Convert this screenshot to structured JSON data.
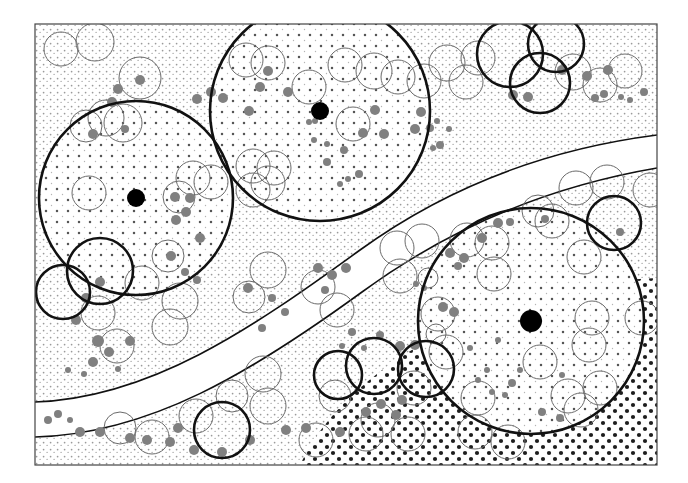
{
  "figure": {
    "title": "",
    "type": "geological-stipple-map",
    "width": 688,
    "height": 483,
    "background_color": "#ffffff",
    "frame": {
      "x": 35,
      "y": 24,
      "width": 622,
      "height": 441,
      "stroke": "#444444",
      "stroke_width": 1.2,
      "fill": "#ffffff"
    }
  },
  "palette": {
    "frame_stroke": "#444444",
    "bold_circle_stroke": "#111111",
    "thin_circle_stroke": "#6a6a6a",
    "grey_blob_fill": "#808080",
    "black_marker_fill": "#000000",
    "fine_stipple_dot": "#9a9a9a",
    "medium_stipple_dot": "#555555",
    "dense_stipple_dot": "#111111",
    "band_fill": "#ffffff",
    "band_stroke": "#111111"
  },
  "regions": [
    {
      "name": "upper-left-fine-stipple-domain",
      "stipple": "fine-light",
      "dot_color": "#9a9a9a",
      "dot_radius": 0.9,
      "spacing": 7
    },
    {
      "name": "upper-right-fine-stipple-domain",
      "stipple": "fine-light",
      "dot_color": "#9a9a9a",
      "dot_radius": 0.9,
      "spacing": 7
    },
    {
      "name": "lower-right-dense-stipple-domain",
      "stipple": "coarse-dark",
      "dot_color": "#111111",
      "dot_radius": 2.1,
      "spacing": 12
    },
    {
      "name": "central-white-band",
      "stipple": "none",
      "dot_color": "#ffffff",
      "dot_radius": 0,
      "spacing": 0
    }
  ],
  "bands": [
    {
      "name": "main-curved-band",
      "upper_path": "M 35,402 C 150,398 250,330 360,250 C 440,192 540,150 657,135",
      "lower_path": "M 35,437 C 150,434 252,372 362,292 C 444,232 540,188 657,168",
      "stroke": "#111111",
      "stroke_width": 1.6,
      "fill": "#ffffff"
    }
  ],
  "mesh_grid_circles": [
    {
      "name": "big-circle-west",
      "cx": 136,
      "cy": 198,
      "r": 97,
      "stroke": "#111111",
      "stroke_width": 2.6,
      "marker": true,
      "marker_r": 9
    },
    {
      "name": "big-circle-north",
      "cx": 320,
      "cy": 111,
      "r": 110,
      "stroke": "#111111",
      "stroke_width": 2.6,
      "marker": true,
      "marker_r": 9
    },
    {
      "name": "big-circle-southeast",
      "cx": 531,
      "cy": 321,
      "r": 113,
      "stroke": "#111111",
      "stroke_width": 2.6,
      "marker": true,
      "marker_r": 11
    }
  ],
  "bold_circles": [
    {
      "name": "bold-circle-nw-edge",
      "cx": 63,
      "cy": 292,
      "r": 27
    },
    {
      "name": "bold-circle-nw-inner",
      "cx": 100,
      "cy": 271,
      "r": 33
    },
    {
      "name": "bold-circle-top-a",
      "cx": 510,
      "cy": 54,
      "r": 33
    },
    {
      "name": "bold-circle-top-b",
      "cx": 556,
      "cy": 44,
      "r": 28
    },
    {
      "name": "bold-circle-top-c",
      "cx": 540,
      "cy": 83,
      "r": 30
    },
    {
      "name": "bold-circle-right-edge",
      "cx": 614,
      "cy": 223,
      "r": 27
    },
    {
      "name": "bold-circle-dense-a",
      "cx": 374,
      "cy": 366,
      "r": 28
    },
    {
      "name": "bold-circle-dense-b",
      "cx": 338,
      "cy": 375,
      "r": 24
    },
    {
      "name": "bold-circle-dense-c",
      "cx": 426,
      "cy": 369,
      "r": 28
    },
    {
      "name": "bold-circle-bottom-dense",
      "cx": 222,
      "cy": 430,
      "r": 28
    }
  ],
  "thin_circles": [
    {
      "cx": 61,
      "cy": 49,
      "r": 17
    },
    {
      "cx": 95,
      "cy": 42,
      "r": 19
    },
    {
      "cx": 140,
      "cy": 78,
      "r": 21
    },
    {
      "cx": 106,
      "cy": 118,
      "r": 18
    },
    {
      "cx": 123,
      "cy": 123,
      "r": 19
    },
    {
      "cx": 86,
      "cy": 126,
      "r": 16
    },
    {
      "cx": 89,
      "cy": 193,
      "r": 17
    },
    {
      "cx": 193,
      "cy": 178,
      "r": 17
    },
    {
      "cx": 211,
      "cy": 182,
      "r": 17
    },
    {
      "cx": 179,
      "cy": 197,
      "r": 16
    },
    {
      "cx": 168,
      "cy": 256,
      "r": 16
    },
    {
      "cx": 142,
      "cy": 283,
      "r": 17
    },
    {
      "cx": 98,
      "cy": 313,
      "r": 17
    },
    {
      "cx": 180,
      "cy": 301,
      "r": 18
    },
    {
      "cx": 117,
      "cy": 346,
      "r": 17
    },
    {
      "cx": 170,
      "cy": 327,
      "r": 18
    },
    {
      "cx": 268,
      "cy": 183,
      "r": 17
    },
    {
      "cx": 246,
      "cy": 60,
      "r": 17
    },
    {
      "cx": 268,
      "cy": 63,
      "r": 17
    },
    {
      "cx": 345,
      "cy": 65,
      "r": 17
    },
    {
      "cx": 374,
      "cy": 71,
      "r": 18
    },
    {
      "cx": 353,
      "cy": 124,
      "r": 17
    },
    {
      "cx": 253,
      "cy": 166,
      "r": 17
    },
    {
      "cx": 274,
      "cy": 168,
      "r": 17
    },
    {
      "cx": 253,
      "cy": 190,
      "r": 17
    },
    {
      "cx": 268,
      "cy": 270,
      "r": 18
    },
    {
      "cx": 249,
      "cy": 297,
      "r": 16
    },
    {
      "cx": 263,
      "cy": 374,
      "r": 18
    },
    {
      "cx": 268,
      "cy": 406,
      "r": 18
    },
    {
      "cx": 232,
      "cy": 396,
      "r": 16
    },
    {
      "cx": 196,
      "cy": 416,
      "r": 17
    },
    {
      "cx": 152,
      "cy": 437,
      "r": 17
    },
    {
      "cx": 120,
      "cy": 428,
      "r": 16
    },
    {
      "cx": 309,
      "cy": 87,
      "r": 17
    },
    {
      "cx": 318,
      "cy": 287,
      "r": 17
    },
    {
      "cx": 337,
      "cy": 310,
      "r": 17
    },
    {
      "cx": 316,
      "cy": 440,
      "r": 17
    },
    {
      "cx": 335,
      "cy": 396,
      "r": 16
    },
    {
      "cx": 398,
      "cy": 77,
      "r": 17
    },
    {
      "cx": 424,
      "cy": 81,
      "r": 17
    },
    {
      "cx": 447,
      "cy": 63,
      "r": 18
    },
    {
      "cx": 466,
      "cy": 82,
      "r": 17
    },
    {
      "cx": 478,
      "cy": 58,
      "r": 17
    },
    {
      "cx": 573,
      "cy": 72,
      "r": 18
    },
    {
      "cx": 600,
      "cy": 85,
      "r": 17
    },
    {
      "cx": 625,
      "cy": 71,
      "r": 17
    },
    {
      "cx": 397,
      "cy": 248,
      "r": 17
    },
    {
      "cx": 422,
      "cy": 241,
      "r": 17
    },
    {
      "cx": 400,
      "cy": 276,
      "r": 17
    },
    {
      "cx": 467,
      "cy": 240,
      "r": 17
    },
    {
      "cx": 492,
      "cy": 243,
      "r": 17
    },
    {
      "cx": 538,
      "cy": 211,
      "r": 16
    },
    {
      "cx": 552,
      "cy": 221,
      "r": 17
    },
    {
      "cx": 576,
      "cy": 188,
      "r": 17
    },
    {
      "cx": 607,
      "cy": 182,
      "r": 17
    },
    {
      "cx": 650,
      "cy": 190,
      "r": 17
    },
    {
      "cx": 494,
      "cy": 274,
      "r": 17
    },
    {
      "cx": 584,
      "cy": 257,
      "r": 17
    },
    {
      "cx": 592,
      "cy": 318,
      "r": 17
    },
    {
      "cx": 589,
      "cy": 345,
      "r": 17
    },
    {
      "cx": 642,
      "cy": 318,
      "r": 17
    },
    {
      "cx": 438,
      "cy": 314,
      "r": 17
    },
    {
      "cx": 446,
      "cy": 352,
      "r": 17
    },
    {
      "cx": 414,
      "cy": 388,
      "r": 17
    },
    {
      "cx": 478,
      "cy": 398,
      "r": 17
    },
    {
      "cx": 540,
      "cy": 362,
      "r": 17
    },
    {
      "cx": 568,
      "cy": 396,
      "r": 17
    },
    {
      "cx": 600,
      "cy": 388,
      "r": 17
    },
    {
      "cx": 581,
      "cy": 410,
      "r": 17
    },
    {
      "cx": 475,
      "cy": 432,
      "r": 17
    },
    {
      "cx": 408,
      "cy": 434,
      "r": 17
    },
    {
      "cx": 378,
      "cy": 420,
      "r": 17
    },
    {
      "cx": 508,
      "cy": 442,
      "r": 17
    },
    {
      "cx": 366,
      "cy": 434,
      "r": 17
    },
    {
      "cx": 428,
      "cy": 278,
      "r": 10
    },
    {
      "cx": 436,
      "cy": 334,
      "r": 10
    }
  ],
  "grey_blobs": [
    {
      "cx": 140,
      "cy": 80,
      "r": 5
    },
    {
      "cx": 118,
      "cy": 89,
      "r": 5
    },
    {
      "cx": 112,
      "cy": 102,
      "r": 5
    },
    {
      "cx": 125,
      "cy": 129,
      "r": 4
    },
    {
      "cx": 93,
      "cy": 134,
      "r": 5
    },
    {
      "cx": 197,
      "cy": 99,
      "r": 5
    },
    {
      "cx": 211,
      "cy": 92,
      "r": 5
    },
    {
      "cx": 223,
      "cy": 98,
      "r": 5
    },
    {
      "cx": 249,
      "cy": 111,
      "r": 5
    },
    {
      "cx": 260,
      "cy": 87,
      "r": 5
    },
    {
      "cx": 288,
      "cy": 92,
      "r": 5
    },
    {
      "cx": 268,
      "cy": 71,
      "r": 5
    },
    {
      "cx": 344,
      "cy": 150,
      "r": 4
    },
    {
      "cx": 375,
      "cy": 110,
      "r": 5
    },
    {
      "cx": 384,
      "cy": 134,
      "r": 5
    },
    {
      "cx": 363,
      "cy": 133,
      "r": 5
    },
    {
      "cx": 309,
      "cy": 122,
      "r": 3
    },
    {
      "cx": 315,
      "cy": 121,
      "r": 3
    },
    {
      "cx": 314,
      "cy": 140,
      "r": 3
    },
    {
      "cx": 327,
      "cy": 144,
      "r": 3
    },
    {
      "cx": 327,
      "cy": 162,
      "r": 4
    },
    {
      "cx": 359,
      "cy": 174,
      "r": 4
    },
    {
      "cx": 348,
      "cy": 179,
      "r": 3
    },
    {
      "cx": 340,
      "cy": 184,
      "r": 3
    },
    {
      "cx": 421,
      "cy": 112,
      "r": 5
    },
    {
      "cx": 415,
      "cy": 129,
      "r": 5
    },
    {
      "cx": 430,
      "cy": 128,
      "r": 4
    },
    {
      "cx": 437,
      "cy": 121,
      "r": 3
    },
    {
      "cx": 440,
      "cy": 145,
      "r": 4
    },
    {
      "cx": 433,
      "cy": 148,
      "r": 3
    },
    {
      "cx": 449,
      "cy": 129,
      "r": 3
    },
    {
      "cx": 513,
      "cy": 95,
      "r": 5
    },
    {
      "cx": 528,
      "cy": 97,
      "r": 5
    },
    {
      "cx": 562,
      "cy": 70,
      "r": 5
    },
    {
      "cx": 587,
      "cy": 76,
      "r": 5
    },
    {
      "cx": 608,
      "cy": 70,
      "r": 5
    },
    {
      "cx": 595,
      "cy": 98,
      "r": 4
    },
    {
      "cx": 604,
      "cy": 94,
      "r": 4
    },
    {
      "cx": 621,
      "cy": 97,
      "r": 3
    },
    {
      "cx": 630,
      "cy": 100,
      "r": 3
    },
    {
      "cx": 644,
      "cy": 92,
      "r": 4
    },
    {
      "cx": 133,
      "cy": 196,
      "r": 4
    },
    {
      "cx": 175,
      "cy": 197,
      "r": 5
    },
    {
      "cx": 190,
      "cy": 198,
      "r": 5
    },
    {
      "cx": 186,
      "cy": 212,
      "r": 5
    },
    {
      "cx": 176,
      "cy": 220,
      "r": 5
    },
    {
      "cx": 200,
      "cy": 238,
      "r": 5
    },
    {
      "cx": 171,
      "cy": 256,
      "r": 5
    },
    {
      "cx": 185,
      "cy": 272,
      "r": 4
    },
    {
      "cx": 197,
      "cy": 280,
      "r": 4
    },
    {
      "cx": 100,
      "cy": 282,
      "r": 5
    },
    {
      "cx": 86,
      "cy": 298,
      "r": 5
    },
    {
      "cx": 76,
      "cy": 320,
      "r": 5
    },
    {
      "cx": 98,
      "cy": 341,
      "r": 6
    },
    {
      "cx": 109,
      "cy": 352,
      "r": 5
    },
    {
      "cx": 130,
      "cy": 341,
      "r": 5
    },
    {
      "cx": 93,
      "cy": 362,
      "r": 5
    },
    {
      "cx": 84,
      "cy": 374,
      "r": 3
    },
    {
      "cx": 68,
      "cy": 370,
      "r": 3
    },
    {
      "cx": 118,
      "cy": 369,
      "r": 3
    },
    {
      "cx": 48,
      "cy": 420,
      "r": 4
    },
    {
      "cx": 58,
      "cy": 414,
      "r": 4
    },
    {
      "cx": 70,
      "cy": 420,
      "r": 3
    },
    {
      "cx": 80,
      "cy": 432,
      "r": 5
    },
    {
      "cx": 100,
      "cy": 432,
      "r": 5
    },
    {
      "cx": 130,
      "cy": 438,
      "r": 5
    },
    {
      "cx": 147,
      "cy": 440,
      "r": 5
    },
    {
      "cx": 170,
      "cy": 442,
      "r": 5
    },
    {
      "cx": 178,
      "cy": 428,
      "r": 5
    },
    {
      "cx": 248,
      "cy": 288,
      "r": 5
    },
    {
      "cx": 272,
      "cy": 298,
      "r": 4
    },
    {
      "cx": 285,
      "cy": 312,
      "r": 4
    },
    {
      "cx": 262,
      "cy": 328,
      "r": 4
    },
    {
      "cx": 318,
      "cy": 268,
      "r": 5
    },
    {
      "cx": 332,
      "cy": 275,
      "r": 5
    },
    {
      "cx": 346,
      "cy": 268,
      "r": 5
    },
    {
      "cx": 325,
      "cy": 290,
      "r": 4
    },
    {
      "cx": 352,
      "cy": 332,
      "r": 4
    },
    {
      "cx": 342,
      "cy": 346,
      "r": 3
    },
    {
      "cx": 364,
      "cy": 348,
      "r": 3
    },
    {
      "cx": 380,
      "cy": 335,
      "r": 4
    },
    {
      "cx": 402,
      "cy": 400,
      "r": 5
    },
    {
      "cx": 381,
      "cy": 404,
      "r": 5
    },
    {
      "cx": 366,
      "cy": 412,
      "r": 5
    },
    {
      "cx": 396,
      "cy": 415,
      "r": 5
    },
    {
      "cx": 415,
      "cy": 345,
      "r": 5
    },
    {
      "cx": 400,
      "cy": 346,
      "r": 5
    },
    {
      "cx": 443,
      "cy": 307,
      "r": 5
    },
    {
      "cx": 454,
      "cy": 312,
      "r": 5
    },
    {
      "cx": 464,
      "cy": 258,
      "r": 5
    },
    {
      "cx": 450,
      "cy": 253,
      "r": 5
    },
    {
      "cx": 482,
      "cy": 238,
      "r": 5
    },
    {
      "cx": 458,
      "cy": 266,
      "r": 4
    },
    {
      "cx": 498,
      "cy": 223,
      "r": 5
    },
    {
      "cx": 510,
      "cy": 222,
      "r": 4
    },
    {
      "cx": 545,
      "cy": 219,
      "r": 4
    },
    {
      "cx": 620,
      "cy": 232,
      "r": 4
    },
    {
      "cx": 562,
      "cy": 375,
      "r": 3
    },
    {
      "cx": 520,
      "cy": 370,
      "r": 3
    },
    {
      "cx": 512,
      "cy": 383,
      "r": 4
    },
    {
      "cx": 487,
      "cy": 370,
      "r": 3
    },
    {
      "cx": 478,
      "cy": 380,
      "r": 3
    },
    {
      "cx": 492,
      "cy": 392,
      "r": 3
    },
    {
      "cx": 505,
      "cy": 395,
      "r": 3
    },
    {
      "cx": 470,
      "cy": 348,
      "r": 3
    },
    {
      "cx": 498,
      "cy": 340,
      "r": 3
    },
    {
      "cx": 340,
      "cy": 432,
      "r": 5
    },
    {
      "cx": 306,
      "cy": 428,
      "r": 5
    },
    {
      "cx": 286,
      "cy": 430,
      "r": 5
    },
    {
      "cx": 250,
      "cy": 440,
      "r": 5
    },
    {
      "cx": 222,
      "cy": 452,
      "r": 5
    },
    {
      "cx": 194,
      "cy": 450,
      "r": 5
    },
    {
      "cx": 542,
      "cy": 412,
      "r": 4
    },
    {
      "cx": 560,
      "cy": 418,
      "r": 4
    },
    {
      "cx": 424,
      "cy": 288,
      "r": 3
    },
    {
      "cx": 416,
      "cy": 284,
      "r": 3
    }
  ],
  "black_markers": [
    {
      "name": "centroid-marker-west",
      "cx": 136,
      "cy": 198,
      "r": 9
    },
    {
      "name": "centroid-marker-north",
      "cx": 320,
      "cy": 111,
      "r": 9
    },
    {
      "name": "centroid-marker-southeast",
      "cx": 531,
      "cy": 321,
      "r": 11
    }
  ]
}
